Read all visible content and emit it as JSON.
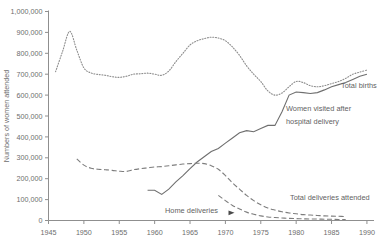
{
  "chart_data": {
    "type": "line",
    "title": "",
    "xlabel": "",
    "ylabel": "Numbers of women attended",
    "xlim": [
      1945,
      1991
    ],
    "ylim": [
      0,
      1000000
    ],
    "grid": false,
    "legend_position": "inline-annotations",
    "x_ticks": [
      "1945",
      "1950",
      "1955",
      "1960",
      "1965",
      "1970",
      "1975",
      "1980",
      "1985",
      "1990"
    ],
    "x_tick_values": [
      1945,
      1950,
      1955,
      1960,
      1965,
      1970,
      1975,
      1980,
      1985,
      1990
    ],
    "y_ticks": [
      "0",
      "100,000",
      "200,000",
      "300,000",
      "400,000",
      "500,000",
      "600,000",
      "700,000",
      "800,000",
      "900,000",
      "1,000,000"
    ],
    "y_tick_values": [
      0,
      100000,
      200000,
      300000,
      400000,
      500000,
      600000,
      700000,
      800000,
      900000,
      1000000
    ],
    "series": [
      {
        "name": "Total births",
        "style": "dotted",
        "color": "#8d8d8d",
        "x": [
          1946,
          1947,
          1948,
          1949,
          1950,
          1951,
          1952,
          1953,
          1954,
          1955,
          1956,
          1957,
          1958,
          1959,
          1960,
          1961,
          1962,
          1963,
          1964,
          1965,
          1966,
          1967,
          1968,
          1969,
          1970,
          1971,
          1972,
          1973,
          1974,
          1975,
          1976,
          1977,
          1978,
          1979,
          1980,
          1981,
          1982,
          1983,
          1984,
          1985,
          1986,
          1987,
          1988,
          1989,
          1990
        ],
        "values": [
          712000,
          810000,
          905000,
          815000,
          730000,
          706000,
          699000,
          695000,
          688000,
          685000,
          690000,
          700000,
          702000,
          705000,
          700000,
          695000,
          715000,
          760000,
          800000,
          840000,
          860000,
          870000,
          877000,
          873000,
          860000,
          830000,
          790000,
          740000,
          700000,
          665000,
          620000,
          600000,
          610000,
          640000,
          665000,
          660000,
          645000,
          640000,
          645000,
          655000,
          665000,
          680000,
          700000,
          710000,
          720000
        ]
      },
      {
        "name": "Women visited after hospital delivery",
        "style": "solid",
        "color": "#6f6f6f",
        "x": [
          1959,
          1960,
          1961,
          1962,
          1963,
          1964,
          1965,
          1966,
          1967,
          1968,
          1969,
          1970,
          1971,
          1972,
          1973,
          1974,
          1975,
          1976,
          1977,
          1978,
          1979,
          1980,
          1981,
          1982,
          1983,
          1984,
          1985,
          1986,
          1987,
          1988,
          1989,
          1990
        ],
        "values": [
          145000,
          145000,
          125000,
          150000,
          185000,
          215000,
          248000,
          280000,
          305000,
          330000,
          345000,
          370000,
          395000,
          420000,
          430000,
          425000,
          440000,
          455000,
          455000,
          520000,
          600000,
          615000,
          612000,
          608000,
          612000,
          625000,
          640000,
          650000,
          660000,
          675000,
          690000,
          700000
        ]
      },
      {
        "name": "Total deliveries attended",
        "style": "dashed",
        "color": "#7d7d7d",
        "x": [
          1949,
          1950,
          1951,
          1952,
          1953,
          1954,
          1955,
          1956,
          1957,
          1958,
          1959,
          1960,
          1961,
          1962,
          1963,
          1964,
          1965,
          1966,
          1967,
          1968,
          1969,
          1970,
          1971,
          1972,
          1973,
          1974,
          1975,
          1976,
          1977,
          1978,
          1979,
          1980,
          1981,
          1982,
          1983,
          1984,
          1985,
          1986,
          1987
        ],
        "values": [
          295000,
          265000,
          250000,
          245000,
          243000,
          240000,
          236000,
          235000,
          243000,
          248000,
          252000,
          256000,
          258000,
          262000,
          266000,
          270000,
          272000,
          274000,
          272000,
          262000,
          245000,
          215000,
          180000,
          150000,
          120000,
          95000,
          75000,
          60000,
          50000,
          42000,
          36000,
          32000,
          28000,
          26000,
          24000,
          22000,
          21000,
          20000,
          19000
        ]
      },
      {
        "name": "Home deliveries",
        "style": "dashed",
        "color": "#7d7d7d",
        "x": [
          1969,
          1970,
          1971,
          1972,
          1973,
          1974,
          1975,
          1976,
          1977,
          1978,
          1979,
          1980,
          1981,
          1982,
          1983,
          1984,
          1985,
          1986,
          1987
        ],
        "values": [
          120000,
          95000,
          72000,
          55000,
          40000,
          30000,
          22000,
          17000,
          14000,
          12000,
          10000,
          9000,
          8000,
          7000,
          7000,
          6000,
          6000,
          5000,
          5000
        ]
      }
    ],
    "annotations": [
      {
        "text": "Total births",
        "series": "Total births"
      },
      {
        "text": "Women visited after",
        "series": "Women visited after hospital delivery"
      },
      {
        "text": "hospital delivery",
        "series": "Women visited after hospital delivery"
      },
      {
        "text": "Total deliveries attended",
        "series": "Total deliveries attended"
      },
      {
        "text": "Home deliveries",
        "series": "Home deliveries"
      }
    ]
  },
  "labels": {
    "y_axis_title": "Numbers of women attended",
    "total_births": "Total births",
    "women_visited_line1": "Women visited after",
    "women_visited_line2": "hospital delivery",
    "total_deliveries": "Total deliveries attended",
    "home_deliveries": "Home deliveries"
  }
}
